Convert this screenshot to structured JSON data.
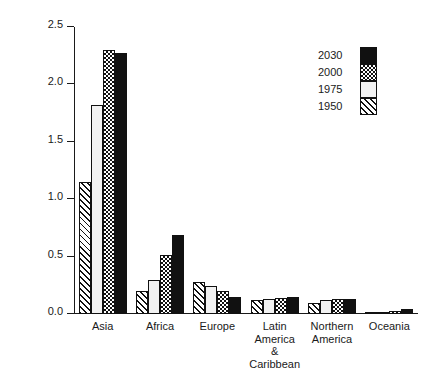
{
  "chart_data": {
    "type": "bar",
    "title": "",
    "subtitle": "",
    "xlabel": "",
    "ylabel": "POPULATION (billions)",
    "ylim": [
      0.0,
      2.5
    ],
    "ytick_labels": [
      "0.0",
      "0.5",
      "1.0",
      "1.5",
      "2.0",
      "2.5"
    ],
    "ytick_values": [
      0.0,
      0.5,
      1.0,
      1.5,
      2.0,
      2.5
    ],
    "grid": false,
    "legend_position": "top-right",
    "categories": [
      "Asia",
      "Africa",
      "Europe",
      "Latin America\n& Caribbean",
      "Northern\nAmerica",
      "Oceania"
    ],
    "series": [
      {
        "name": "1950",
        "pattern": "diagonal-hatch",
        "values": [
          1.15,
          0.2,
          0.28,
          0.12,
          0.1,
          0.01
        ]
      },
      {
        "name": "1975",
        "pattern": "stipple-dots",
        "values": [
          1.82,
          0.3,
          0.24,
          0.13,
          0.12,
          0.02
        ]
      },
      {
        "name": "2000",
        "pattern": "checkerboard",
        "values": [
          2.3,
          0.51,
          0.2,
          0.14,
          0.13,
          0.03
        ]
      },
      {
        "name": "2030",
        "pattern": "solid-black",
        "values": [
          2.27,
          0.69,
          0.15,
          0.15,
          0.13,
          0.04
        ]
      }
    ],
    "legend_entries": [
      {
        "label": "2030",
        "pattern": "solid-black"
      },
      {
        "label": "2000",
        "pattern": "checkerboard"
      },
      {
        "label": "1975",
        "pattern": "stipple-dots"
      },
      {
        "label": "1950",
        "pattern": "diagonal-hatch"
      }
    ],
    "colors": {
      "ink": "#111111",
      "background": "#ffffff"
    }
  }
}
